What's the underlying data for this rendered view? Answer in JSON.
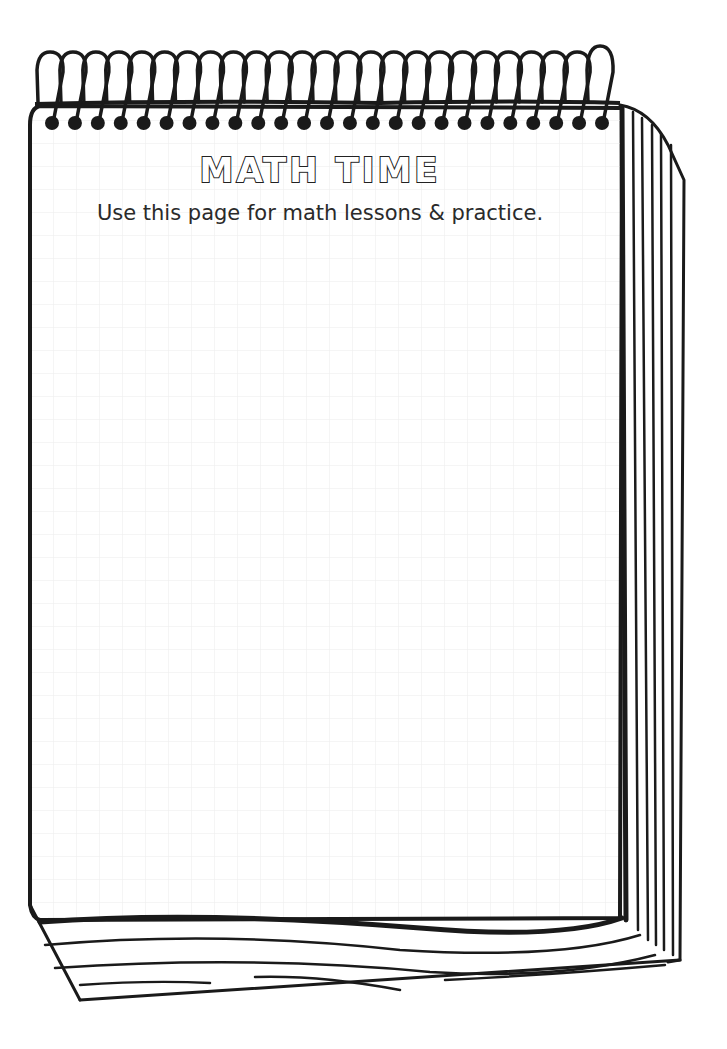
{
  "worksheet": {
    "title": "MATH TIME",
    "subtitle": "Use this page for math lessons & practice."
  },
  "notepad": {
    "spiral_ring_count": 25,
    "grid_spacing_px": 23,
    "grid_color": "#eeeeee",
    "line_color": "#1a1a1a"
  }
}
